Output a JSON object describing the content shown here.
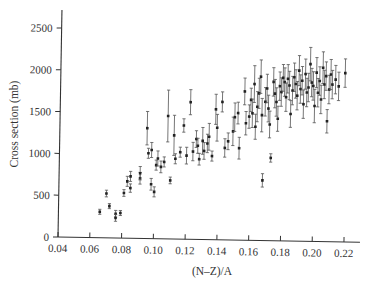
{
  "chart_data": {
    "type": "scatter",
    "title": "",
    "xlabel": "(N–Z)/A",
    "ylabel": "Cross section (mb)",
    "xlim": [
      0.04,
      0.23
    ],
    "ylim": [
      0,
      2700
    ],
    "grid": false,
    "legend": null,
    "x_ticks": [
      "0.04",
      "0.06",
      "0.08",
      "0.10",
      "0.12",
      "0.14",
      "0.16",
      "0.18",
      "0.20",
      "0.22"
    ],
    "y_ticks": [
      "0",
      "500",
      "1000",
      "1500",
      "2000",
      "2500"
    ],
    "series": [
      {
        "name": "data",
        "error_bars": true,
        "points": [
          {
            "x": 0.066,
            "y": 310,
            "err": 30
          },
          {
            "x": 0.07,
            "y": 530,
            "err": 40
          },
          {
            "x": 0.072,
            "y": 380,
            "err": 30
          },
          {
            "x": 0.076,
            "y": 290,
            "err": 40
          },
          {
            "x": 0.076,
            "y": 240,
            "err": 40
          },
          {
            "x": 0.079,
            "y": 300,
            "err": 30
          },
          {
            "x": 0.081,
            "y": 540,
            "err": 40
          },
          {
            "x": 0.083,
            "y": 680,
            "err": 60
          },
          {
            "x": 0.085,
            "y": 740,
            "err": 60
          },
          {
            "x": 0.085,
            "y": 600,
            "err": 50
          },
          {
            "x": 0.091,
            "y": 720,
            "err": 70
          },
          {
            "x": 0.091,
            "y": 780,
            "err": 80
          },
          {
            "x": 0.095,
            "y": 1320,
            "err": 200
          },
          {
            "x": 0.096,
            "y": 1020,
            "err": 60
          },
          {
            "x": 0.098,
            "y": 1060,
            "err": 90
          },
          {
            "x": 0.098,
            "y": 650,
            "err": 70
          },
          {
            "x": 0.1,
            "y": 560,
            "err": 60
          },
          {
            "x": 0.101,
            "y": 880,
            "err": 60
          },
          {
            "x": 0.102,
            "y": 960,
            "err": 90
          },
          {
            "x": 0.104,
            "y": 860,
            "err": 70
          },
          {
            "x": 0.106,
            "y": 920,
            "err": 60
          },
          {
            "x": 0.108,
            "y": 1470,
            "err": 310
          },
          {
            "x": 0.11,
            "y": 700,
            "err": 40
          },
          {
            "x": 0.112,
            "y": 1240,
            "err": 240
          },
          {
            "x": 0.113,
            "y": 960,
            "err": 60
          },
          {
            "x": 0.116,
            "y": 1040,
            "err": 60
          },
          {
            "x": 0.118,
            "y": 1360,
            "err": 80
          },
          {
            "x": 0.12,
            "y": 1000,
            "err": 100
          },
          {
            "x": 0.122,
            "y": 1640,
            "err": 150
          },
          {
            "x": 0.124,
            "y": 1050,
            "err": 110
          },
          {
            "x": 0.126,
            "y": 1200,
            "err": 100
          },
          {
            "x": 0.127,
            "y": 1120,
            "err": 90
          },
          {
            "x": 0.128,
            "y": 960,
            "err": 70
          },
          {
            "x": 0.13,
            "y": 1180,
            "err": 160
          },
          {
            "x": 0.131,
            "y": 1060,
            "err": 100
          },
          {
            "x": 0.133,
            "y": 1150,
            "err": 110
          },
          {
            "x": 0.134,
            "y": 1230,
            "err": 160
          },
          {
            "x": 0.136,
            "y": 1000,
            "err": 60
          },
          {
            "x": 0.138,
            "y": 1560,
            "err": 180
          },
          {
            "x": 0.139,
            "y": 1340,
            "err": 160
          },
          {
            "x": 0.142,
            "y": 1650,
            "err": 120
          },
          {
            "x": 0.144,
            "y": 1100,
            "err": 110
          },
          {
            "x": 0.146,
            "y": 1180,
            "err": 100
          },
          {
            "x": 0.149,
            "y": 1300,
            "err": 170
          },
          {
            "x": 0.15,
            "y": 1470,
            "err": 170
          },
          {
            "x": 0.152,
            "y": 1520,
            "err": 130
          },
          {
            "x": 0.153,
            "y": 1100,
            "err": 130
          },
          {
            "x": 0.156,
            "y": 1780,
            "err": 160
          },
          {
            "x": 0.157,
            "y": 1400,
            "err": 140
          },
          {
            "x": 0.159,
            "y": 1480,
            "err": 140
          },
          {
            "x": 0.16,
            "y": 1680,
            "err": 140
          },
          {
            "x": 0.161,
            "y": 1520,
            "err": 170
          },
          {
            "x": 0.162,
            "y": 1870,
            "err": 220
          },
          {
            "x": 0.163,
            "y": 1360,
            "err": 150
          },
          {
            "x": 0.164,
            "y": 1600,
            "err": 180
          },
          {
            "x": 0.165,
            "y": 1760,
            "err": 180
          },
          {
            "x": 0.166,
            "y": 1960,
            "err": 200
          },
          {
            "x": 0.167,
            "y": 1500,
            "err": 200
          },
          {
            "x": 0.168,
            "y": 720,
            "err": 80
          },
          {
            "x": 0.169,
            "y": 1660,
            "err": 170
          },
          {
            "x": 0.17,
            "y": 1820,
            "err": 170
          },
          {
            "x": 0.171,
            "y": 1580,
            "err": 160
          },
          {
            "x": 0.172,
            "y": 1390,
            "err": 160
          },
          {
            "x": 0.173,
            "y": 990,
            "err": 50
          },
          {
            "x": 0.174,
            "y": 1900,
            "err": 170
          },
          {
            "x": 0.175,
            "y": 1760,
            "err": 170
          },
          {
            "x": 0.176,
            "y": 1660,
            "err": 170
          },
          {
            "x": 0.177,
            "y": 1460,
            "err": 150
          },
          {
            "x": 0.178,
            "y": 1850,
            "err": 170
          },
          {
            "x": 0.179,
            "y": 1780,
            "err": 170
          },
          {
            "x": 0.18,
            "y": 1950,
            "err": 160
          },
          {
            "x": 0.181,
            "y": 1900,
            "err": 170
          },
          {
            "x": 0.182,
            "y": 1720,
            "err": 170
          },
          {
            "x": 0.183,
            "y": 1940,
            "err": 170
          },
          {
            "x": 0.184,
            "y": 1860,
            "err": 170
          },
          {
            "x": 0.185,
            "y": 1520,
            "err": 160
          },
          {
            "x": 0.186,
            "y": 1800,
            "err": 170
          },
          {
            "x": 0.187,
            "y": 1960,
            "err": 170
          },
          {
            "x": 0.188,
            "y": 1880,
            "err": 170
          },
          {
            "x": 0.189,
            "y": 1740,
            "err": 170
          },
          {
            "x": 0.19,
            "y": 2040,
            "err": 180
          },
          {
            "x": 0.191,
            "y": 1820,
            "err": 170
          },
          {
            "x": 0.192,
            "y": 1920,
            "err": 170
          },
          {
            "x": 0.193,
            "y": 1640,
            "err": 170
          },
          {
            "x": 0.194,
            "y": 2000,
            "err": 180
          },
          {
            "x": 0.195,
            "y": 1780,
            "err": 170
          },
          {
            "x": 0.196,
            "y": 1840,
            "err": 170
          },
          {
            "x": 0.197,
            "y": 2120,
            "err": 200
          },
          {
            "x": 0.198,
            "y": 1900,
            "err": 170
          },
          {
            "x": 0.199,
            "y": 1860,
            "err": 170
          },
          {
            "x": 0.2,
            "y": 1620,
            "err": 200
          },
          {
            "x": 0.201,
            "y": 2020,
            "err": 180
          },
          {
            "x": 0.202,
            "y": 1780,
            "err": 170
          },
          {
            "x": 0.203,
            "y": 1920,
            "err": 170
          },
          {
            "x": 0.204,
            "y": 1700,
            "err": 170
          },
          {
            "x": 0.205,
            "y": 2080,
            "err": 190
          },
          {
            "x": 0.206,
            "y": 1880,
            "err": 170
          },
          {
            "x": 0.207,
            "y": 1980,
            "err": 170
          },
          {
            "x": 0.208,
            "y": 1440,
            "err": 140
          },
          {
            "x": 0.209,
            "y": 1820,
            "err": 170
          },
          {
            "x": 0.21,
            "y": 2000,
            "err": 180
          },
          {
            "x": 0.211,
            "y": 1880,
            "err": 170
          },
          {
            "x": 0.213,
            "y": 1940,
            "err": 170
          },
          {
            "x": 0.215,
            "y": 1860,
            "err": 170
          },
          {
            "x": 0.219,
            "y": 2020,
            "err": 170
          }
        ]
      }
    ]
  }
}
